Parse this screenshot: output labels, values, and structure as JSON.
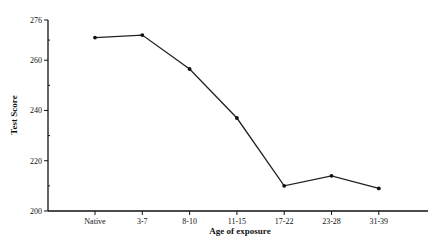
{
  "chart_data": {
    "type": "line",
    "title": "",
    "xlabel": "Age of exposure",
    "ylabel": "Test Score",
    "categories": [
      "Native",
      "3-7",
      "8-10",
      "11-15",
      "17-22",
      "23-28",
      "31-39"
    ],
    "series": [
      {
        "name": "Test Score",
        "values": [
          269,
          270,
          256.5,
          237,
          210,
          214,
          209
        ]
      }
    ],
    "ylim": [
      200,
      276
    ],
    "yticks": [
      200,
      220,
      240,
      260,
      276
    ],
    "yticks_minor": [
      210,
      230,
      250,
      268
    ],
    "grid": false,
    "legend": "none"
  }
}
